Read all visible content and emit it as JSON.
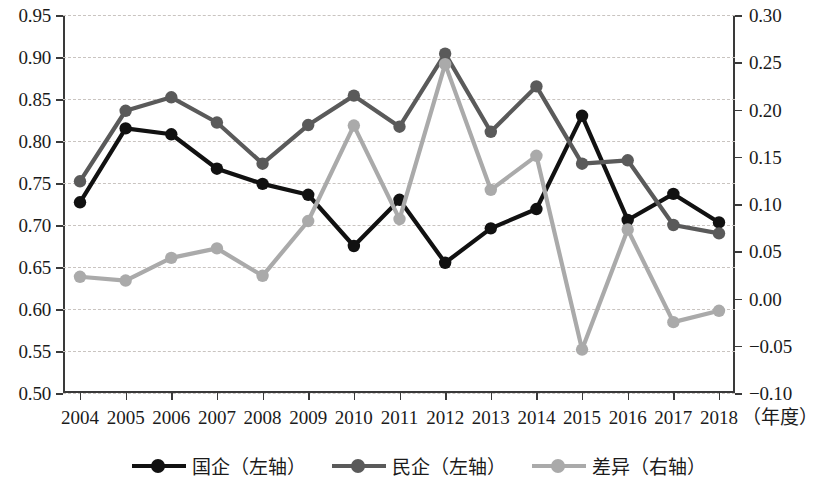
{
  "chart_data": {
    "type": "line",
    "title": "",
    "xlabel": "（年度）",
    "x": [
      2004,
      2005,
      2006,
      2007,
      2008,
      2009,
      2010,
      2011,
      2012,
      2013,
      2014,
      2015,
      2016,
      2017,
      2018
    ],
    "xtick_labels": [
      "2004",
      "2005",
      "2006",
      "2007",
      "2008",
      "2009",
      "2010",
      "2011",
      "2012",
      "2013",
      "2014",
      "2015",
      "2016",
      "2017",
      "2018"
    ],
    "grid": true,
    "legend_position": "bottom",
    "axes": [
      {
        "id": "left",
        "name": "左轴",
        "ylim": [
          0.5,
          0.95
        ],
        "ytick_labels": [
          "0.95",
          "0.90",
          "0.85",
          "0.80",
          "0.75",
          "0.70",
          "0.65",
          "0.60",
          "0.55",
          "0.50"
        ],
        "yticks": [
          0.95,
          0.9,
          0.85,
          0.8,
          0.75,
          0.7,
          0.65,
          0.6,
          0.55,
          0.5
        ]
      },
      {
        "id": "right",
        "name": "右轴",
        "ylim": [
          -0.1,
          0.3
        ],
        "ytick_labels": [
          "0.30",
          "0.25",
          "0.20",
          "0.15",
          "0.10",
          "0.05",
          "0.00",
          "−0.05",
          "−0.10"
        ],
        "yticks": [
          0.3,
          0.25,
          0.2,
          0.15,
          0.1,
          0.05,
          0.0,
          -0.05,
          -0.1
        ]
      }
    ],
    "series": [
      {
        "name": "国企（左轴）",
        "short": "国企",
        "axis": "left",
        "color": "#111111",
        "marker": "circle",
        "values": [
          0.727,
          0.815,
          0.808,
          0.767,
          0.749,
          0.736,
          0.675,
          0.73,
          0.655,
          0.696,
          0.719,
          0.83,
          0.706,
          0.737,
          0.703
        ]
      },
      {
        "name": "民企（左轴）",
        "short": "民企",
        "axis": "left",
        "color": "#5a5a5a",
        "marker": "circle",
        "values": [
          0.752,
          0.836,
          0.852,
          0.822,
          0.773,
          0.819,
          0.854,
          0.817,
          0.904,
          0.811,
          0.865,
          0.773,
          0.777,
          0.7,
          0.69
        ]
      },
      {
        "name": "差异（右轴）",
        "short": "差异",
        "axis": "right",
        "color": "#aaaaaa",
        "marker": "circle",
        "values": [
          0.023,
          0.019,
          0.043,
          0.053,
          0.024,
          0.082,
          0.183,
          0.084,
          0.248,
          0.115,
          0.151,
          -0.054,
          0.073,
          -0.025,
          -0.013
        ]
      }
    ]
  },
  "legend": {
    "items": [
      {
        "label": "国企（左轴）",
        "color": "#111111"
      },
      {
        "label": "民企（左轴）",
        "color": "#5a5a5a"
      },
      {
        "label": "差异（右轴）",
        "color": "#aaaaaa"
      }
    ]
  }
}
